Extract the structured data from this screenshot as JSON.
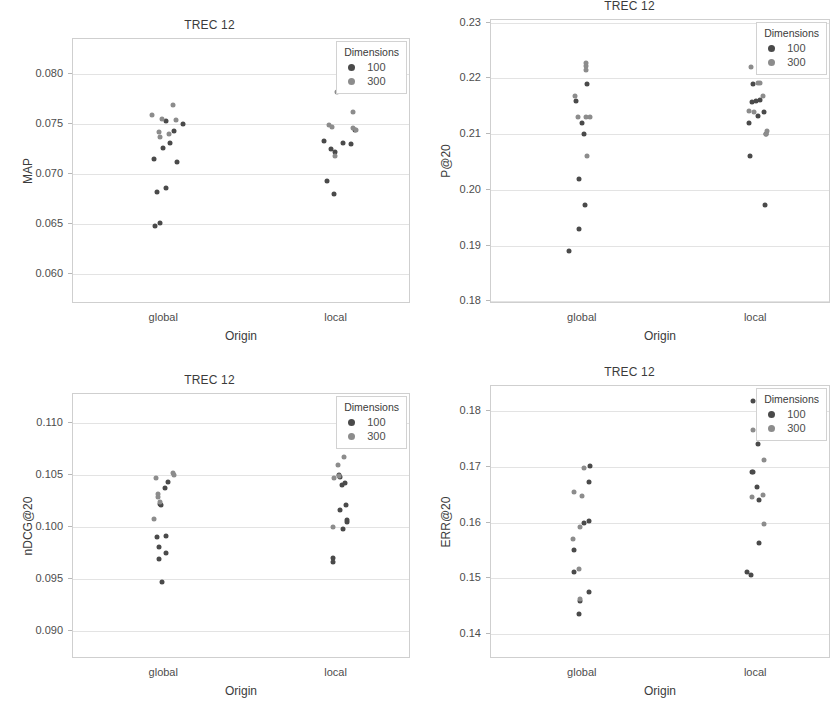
{
  "figure": {
    "width": 839,
    "height": 714,
    "background": "#ffffff",
    "panel_count": 4
  },
  "legend": {
    "title": "Dimensions",
    "entries": [
      {
        "label": "100",
        "color": "#4a4a4a",
        "size": 7
      },
      {
        "label": "300",
        "color": "#8c8c8c",
        "size": 7
      }
    ]
  },
  "chart_data": [
    {
      "id": "map",
      "type": "scatter",
      "title": "TREC 12",
      "xlabel": "Origin",
      "ylabel": "MAP",
      "categories": [
        "global",
        "local"
      ],
      "yticks": [
        0.06,
        0.065,
        0.07,
        0.075,
        0.08
      ],
      "ytick_labels": [
        "0.060",
        "0.065",
        "0.070",
        "0.075",
        "0.080"
      ],
      "ylim": [
        0.057,
        0.0835
      ],
      "grid": true,
      "legend_position": "top-right",
      "series": [
        {
          "name": "100",
          "color": "#4a4a4a",
          "points": [
            {
              "x": "global",
              "jitter": -0.1,
              "y": 0.0715
            },
            {
              "x": "global",
              "jitter": 0.02,
              "y": 0.0753
            },
            {
              "x": "global",
              "jitter": 0.1,
              "y": 0.0743
            },
            {
              "x": "global",
              "jitter": 0.18,
              "y": 0.075
            },
            {
              "x": "global",
              "jitter": 0.06,
              "y": 0.0731
            },
            {
              "x": "global",
              "jitter": -0.01,
              "y": 0.0726
            },
            {
              "x": "global",
              "jitter": 0.13,
              "y": 0.0712
            },
            {
              "x": "global",
              "jitter": -0.07,
              "y": 0.0682
            },
            {
              "x": "global",
              "jitter": 0.02,
              "y": 0.0686
            },
            {
              "x": "global",
              "jitter": -0.09,
              "y": 0.0648
            },
            {
              "x": "global",
              "jitter": -0.04,
              "y": 0.0651
            },
            {
              "x": "local",
              "jitter": -0.12,
              "y": 0.0733
            },
            {
              "x": "local",
              "jitter": -0.06,
              "y": 0.0725
            },
            {
              "x": "local",
              "jitter": -0.02,
              "y": 0.0722
            },
            {
              "x": "local",
              "jitter": 0.06,
              "y": 0.0731
            },
            {
              "x": "local",
              "jitter": 0.14,
              "y": 0.073
            },
            {
              "x": "local",
              "jitter": 0.18,
              "y": 0.0744
            },
            {
              "x": "local",
              "jitter": -0.1,
              "y": 0.0693
            },
            {
              "x": "local",
              "jitter": -0.03,
              "y": 0.068
            }
          ]
        },
        {
          "name": "300",
          "color": "#8c8c8c",
          "points": [
            {
              "x": "global",
              "jitter": -0.12,
              "y": 0.0759
            },
            {
              "x": "global",
              "jitter": -0.02,
              "y": 0.0755
            },
            {
              "x": "global",
              "jitter": -0.05,
              "y": 0.0742
            },
            {
              "x": "global",
              "jitter": -0.04,
              "y": 0.0737
            },
            {
              "x": "global",
              "jitter": 0.09,
              "y": 0.0769
            },
            {
              "x": "global",
              "jitter": 0.12,
              "y": 0.0754
            },
            {
              "x": "global",
              "jitter": 0.05,
              "y": 0.074
            },
            {
              "x": "local",
              "jitter": 0.0,
              "y": 0.0782
            },
            {
              "x": "local",
              "jitter": 0.16,
              "y": 0.0762
            },
            {
              "x": "local",
              "jitter": -0.08,
              "y": 0.0749
            },
            {
              "x": "local",
              "jitter": -0.05,
              "y": 0.0747
            },
            {
              "x": "local",
              "jitter": 0.16,
              "y": 0.0746
            },
            {
              "x": "local",
              "jitter": 0.19,
              "y": 0.0744
            },
            {
              "x": "local",
              "jitter": -0.02,
              "y": 0.0718
            }
          ]
        }
      ]
    },
    {
      "id": "p20",
      "type": "scatter",
      "title": "TREC 12",
      "xlabel": "Origin",
      "ylabel": "P@20",
      "categories": [
        "global",
        "local"
      ],
      "yticks": [
        0.18,
        0.19,
        0.2,
        0.21,
        0.22,
        0.23
      ],
      "ytick_labels": [
        "0.18",
        "0.19",
        "0.20",
        "0.21",
        "0.22",
        "0.23"
      ],
      "ylim": [
        0.1795,
        0.2305
      ],
      "grid": true,
      "legend_position": "top-right",
      "series": [
        {
          "name": "100",
          "color": "#4a4a4a",
          "points": [
            {
              "x": "global",
              "jitter": 0.04,
              "y": 0.219
            },
            {
              "x": "global",
              "jitter": -0.07,
              "y": 0.216
            },
            {
              "x": "global",
              "jitter": -0.01,
              "y": 0.212
            },
            {
              "x": "global",
              "jitter": 0.01,
              "y": 0.21
            },
            {
              "x": "global",
              "jitter": -0.04,
              "y": 0.202
            },
            {
              "x": "global",
              "jitter": 0.02,
              "y": 0.1973
            },
            {
              "x": "global",
              "jitter": -0.04,
              "y": 0.193
            },
            {
              "x": "global",
              "jitter": -0.14,
              "y": 0.189
            },
            {
              "x": "local",
              "jitter": -0.03,
              "y": 0.219
            },
            {
              "x": "local",
              "jitter": 0.04,
              "y": 0.2162
            },
            {
              "x": "local",
              "jitter": 0.0,
              "y": 0.216
            },
            {
              "x": "local",
              "jitter": -0.04,
              "y": 0.2158
            },
            {
              "x": "local",
              "jitter": -0.07,
              "y": 0.212
            },
            {
              "x": "local",
              "jitter": 0.02,
              "y": 0.2132
            },
            {
              "x": "local",
              "jitter": 0.08,
              "y": 0.214
            },
            {
              "x": "local",
              "jitter": 0.1,
              "y": 0.21
            },
            {
              "x": "local",
              "jitter": -0.06,
              "y": 0.206
            },
            {
              "x": "local",
              "jitter": 0.09,
              "y": 0.1972
            }
          ]
        },
        {
          "name": "300",
          "color": "#8c8c8c",
          "points": [
            {
              "x": "global",
              "jitter": 0.03,
              "y": 0.2228
            },
            {
              "x": "global",
              "jitter": 0.03,
              "y": 0.2222
            },
            {
              "x": "global",
              "jitter": 0.03,
              "y": 0.2215
            },
            {
              "x": "global",
              "jitter": -0.08,
              "y": 0.2168
            },
            {
              "x": "global",
              "jitter": -0.05,
              "y": 0.213
            },
            {
              "x": "global",
              "jitter": 0.03,
              "y": 0.213
            },
            {
              "x": "global",
              "jitter": 0.07,
              "y": 0.213
            },
            {
              "x": "global",
              "jitter": 0.04,
              "y": 0.206
            },
            {
              "x": "local",
              "jitter": -0.05,
              "y": 0.222
            },
            {
              "x": "local",
              "jitter": 0.02,
              "y": 0.2192
            },
            {
              "x": "local",
              "jitter": 0.04,
              "y": 0.2192
            },
            {
              "x": "local",
              "jitter": 0.07,
              "y": 0.2168
            },
            {
              "x": "local",
              "jitter": -0.02,
              "y": 0.214
            },
            {
              "x": "local",
              "jitter": -0.07,
              "y": 0.2142
            },
            {
              "x": "local",
              "jitter": 0.11,
              "y": 0.2105
            },
            {
              "x": "local",
              "jitter": 0.1,
              "y": 0.21
            }
          ]
        }
      ]
    },
    {
      "id": "ndcg20",
      "type": "scatter",
      "title": "TREC 12",
      "xlabel": "Origin",
      "ylabel": "nDCG@20",
      "categories": [
        "global",
        "local"
      ],
      "yticks": [
        0.09,
        0.095,
        0.1,
        0.105,
        0.11
      ],
      "ytick_labels": [
        "0.090",
        "0.095",
        "0.100",
        "0.105",
        "0.110"
      ],
      "ylim": [
        0.0873,
        0.1128
      ],
      "grid": true,
      "legend_position": "top-right",
      "series": [
        {
          "name": "100",
          "color": "#4a4a4a",
          "points": [
            {
              "x": "global",
              "jitter": 0.04,
              "y": 0.1043
            },
            {
              "x": "global",
              "jitter": 0.01,
              "y": 0.1038
            },
            {
              "x": "global",
              "jitter": -0.04,
              "y": 0.1022
            },
            {
              "x": "global",
              "jitter": -0.03,
              "y": 0.1021
            },
            {
              "x": "global",
              "jitter": -0.07,
              "y": 0.099
            },
            {
              "x": "global",
              "jitter": -0.05,
              "y": 0.0981
            },
            {
              "x": "global",
              "jitter": -0.05,
              "y": 0.0969
            },
            {
              "x": "global",
              "jitter": 0.02,
              "y": 0.0991
            },
            {
              "x": "global",
              "jitter": 0.02,
              "y": 0.0975
            },
            {
              "x": "global",
              "jitter": -0.02,
              "y": 0.0947
            },
            {
              "x": "local",
              "jitter": 0.02,
              "y": 0.105
            },
            {
              "x": "local",
              "jitter": 0.03,
              "y": 0.1048
            },
            {
              "x": "local",
              "jitter": 0.08,
              "y": 0.1042
            },
            {
              "x": "local",
              "jitter": 0.05,
              "y": 0.104
            },
            {
              "x": "local",
              "jitter": 0.09,
              "y": 0.1021
            },
            {
              "x": "local",
              "jitter": 0.03,
              "y": 0.1016
            },
            {
              "x": "local",
              "jitter": 0.1,
              "y": 0.1007
            },
            {
              "x": "local",
              "jitter": 0.1,
              "y": 0.1005
            },
            {
              "x": "local",
              "jitter": 0.06,
              "y": 0.0998
            },
            {
              "x": "local",
              "jitter": -0.04,
              "y": 0.097
            },
            {
              "x": "local",
              "jitter": -0.04,
              "y": 0.0966
            }
          ]
        },
        {
          "name": "300",
          "color": "#8c8c8c",
          "points": [
            {
              "x": "global",
              "jitter": -0.08,
              "y": 0.1047
            },
            {
              "x": "global",
              "jitter": -0.06,
              "y": 0.1032
            },
            {
              "x": "global",
              "jitter": -0.06,
              "y": 0.1029
            },
            {
              "x": "global",
              "jitter": -0.04,
              "y": 0.1024
            },
            {
              "x": "global",
              "jitter": -0.1,
              "y": 0.1008
            },
            {
              "x": "global",
              "jitter": 0.09,
              "y": 0.1052
            },
            {
              "x": "global",
              "jitter": 0.1,
              "y": 0.105
            },
            {
              "x": "local",
              "jitter": 0.01,
              "y": 0.106
            },
            {
              "x": "local",
              "jitter": 0.07,
              "y": 0.1067
            },
            {
              "x": "local",
              "jitter": -0.03,
              "y": 0.1047
            },
            {
              "x": "local",
              "jitter": 0.02,
              "y": 0.1049
            },
            {
              "x": "local",
              "jitter": -0.04,
              "y": 0.1
            }
          ]
        }
      ]
    },
    {
      "id": "err20",
      "type": "scatter",
      "title": "TREC 12",
      "xlabel": "Origin",
      "ylabel": "ERR@20",
      "categories": [
        "global",
        "local"
      ],
      "yticks": [
        0.14,
        0.15,
        0.16,
        0.17,
        0.18
      ],
      "ytick_labels": [
        "0.14",
        "0.15",
        "0.16",
        "0.17",
        "0.18"
      ],
      "ylim": [
        0.1355,
        0.1845
      ],
      "grid": true,
      "legend_position": "top-right",
      "series": [
        {
          "name": "100",
          "color": "#4a4a4a",
          "points": [
            {
              "x": "global",
              "jitter": 0.07,
              "y": 0.1702
            },
            {
              "x": "global",
              "jitter": 0.06,
              "y": 0.1672
            },
            {
              "x": "global",
              "jitter": 0.01,
              "y": 0.16
            },
            {
              "x": "global",
              "jitter": 0.06,
              "y": 0.1603
            },
            {
              "x": "global",
              "jitter": -0.09,
              "y": 0.1551
            },
            {
              "x": "global",
              "jitter": -0.09,
              "y": 0.1512
            },
            {
              "x": "global",
              "jitter": -0.03,
              "y": 0.1459
            },
            {
              "x": "global",
              "jitter": -0.04,
              "y": 0.1435
            },
            {
              "x": "global",
              "jitter": 0.06,
              "y": 0.1475
            },
            {
              "x": "local",
              "jitter": -0.03,
              "y": 0.1818
            },
            {
              "x": "local",
              "jitter": 0.02,
              "y": 0.1741
            },
            {
              "x": "local",
              "jitter": 0.04,
              "y": 0.1766
            },
            {
              "x": "local",
              "jitter": -0.04,
              "y": 0.1691
            },
            {
              "x": "local",
              "jitter": -0.03,
              "y": 0.169
            },
            {
              "x": "local",
              "jitter": 0.01,
              "y": 0.1663
            },
            {
              "x": "local",
              "jitter": 0.03,
              "y": 0.1641
            },
            {
              "x": "local",
              "jitter": 0.03,
              "y": 0.1563
            },
            {
              "x": "local",
              "jitter": -0.09,
              "y": 0.1512
            },
            {
              "x": "local",
              "jitter": -0.05,
              "y": 0.1506
            }
          ]
        },
        {
          "name": "300",
          "color": "#8c8c8c",
          "points": [
            {
              "x": "global",
              "jitter": 0.01,
              "y": 0.1698
            },
            {
              "x": "global",
              "jitter": -0.09,
              "y": 0.1655
            },
            {
              "x": "global",
              "jitter": -0.01,
              "y": 0.1648
            },
            {
              "x": "global",
              "jitter": -0.03,
              "y": 0.1592
            },
            {
              "x": "global",
              "jitter": -0.1,
              "y": 0.157
            },
            {
              "x": "global",
              "jitter": -0.04,
              "y": 0.1516
            },
            {
              "x": "global",
              "jitter": -0.03,
              "y": 0.1462
            },
            {
              "x": "local",
              "jitter": -0.03,
              "y": 0.1766
            },
            {
              "x": "local",
              "jitter": 0.07,
              "y": 0.1763
            },
            {
              "x": "local",
              "jitter": 0.08,
              "y": 0.1713
            },
            {
              "x": "local",
              "jitter": -0.04,
              "y": 0.1645
            },
            {
              "x": "local",
              "jitter": 0.07,
              "y": 0.165
            },
            {
              "x": "local",
              "jitter": 0.08,
              "y": 0.1597
            }
          ]
        }
      ]
    }
  ]
}
